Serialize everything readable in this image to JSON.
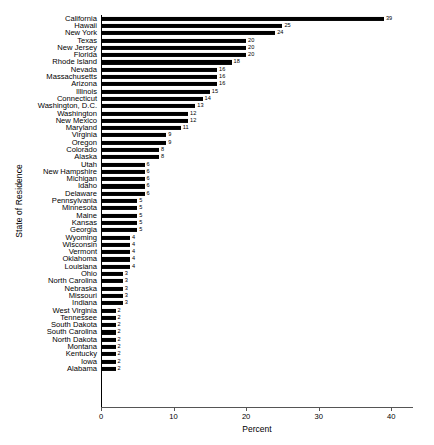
{
  "chart_data": {
    "type": "bar",
    "orientation": "horizontal",
    "title": "",
    "xlabel": "Percent",
    "ylabel": "State of Residence",
    "xlim": [
      0,
      43
    ],
    "xticks": [
      0,
      10,
      20,
      30,
      40
    ],
    "grid": false,
    "legend": null,
    "bar_color": "#000000",
    "categories": [
      "California",
      "Hawaii",
      "New York",
      "Texas",
      "New Jersey",
      "Florida",
      "Rhode Island",
      "Nevada",
      "Massachusetts",
      "Arizona",
      "Illinois",
      "Connecticut",
      "Washington, D.C.",
      "Washington",
      "New Mexico",
      "Maryland",
      "Virginia",
      "Oregon",
      "Colorado",
      "Alaska",
      "Utah",
      "New Hampshire",
      "Michigan",
      "Idaho",
      "Delaware",
      "Pennsylvania",
      "Minnesota",
      "Maine",
      "Kansas",
      "Georgia",
      "Wyoming",
      "Wisconsin",
      "Vermont",
      "Oklahoma",
      "Louisiana",
      "Ohio",
      "North Carolina",
      "Nebraska",
      "Missouri",
      "Indiana",
      "West Virginia",
      "Tennessee",
      "South Dakota",
      "South Carolina",
      "North Dakota",
      "Montana",
      "Kentucky",
      "Iowa",
      "Alabama"
    ],
    "values": [
      39,
      25,
      24,
      20,
      20,
      20,
      18,
      16,
      16,
      16,
      15,
      14,
      13,
      12,
      12,
      11,
      9,
      9,
      8,
      8,
      6,
      6,
      6,
      6,
      6,
      5,
      5,
      5,
      5,
      5,
      4,
      4,
      4,
      4,
      4,
      3,
      3,
      3,
      3,
      3,
      2,
      2,
      2,
      2,
      2,
      2,
      2,
      2,
      2
    ],
    "value_labels": [
      "39",
      "25",
      "24",
      "20",
      "20",
      "20",
      "18",
      "16",
      "16",
      "16",
      "15",
      "14",
      "13",
      "12",
      "12",
      "11",
      "9",
      "9",
      "8",
      "8",
      "6",
      "6",
      "6",
      "6",
      "6",
      "5",
      "5",
      "5",
      "5",
      "5",
      "4",
      "4",
      "4",
      "4",
      "4",
      "3",
      "3",
      "3",
      "3",
      "3",
      "2",
      "2",
      "2",
      "2",
      "2",
      "2",
      "2",
      "2",
      "2"
    ]
  }
}
